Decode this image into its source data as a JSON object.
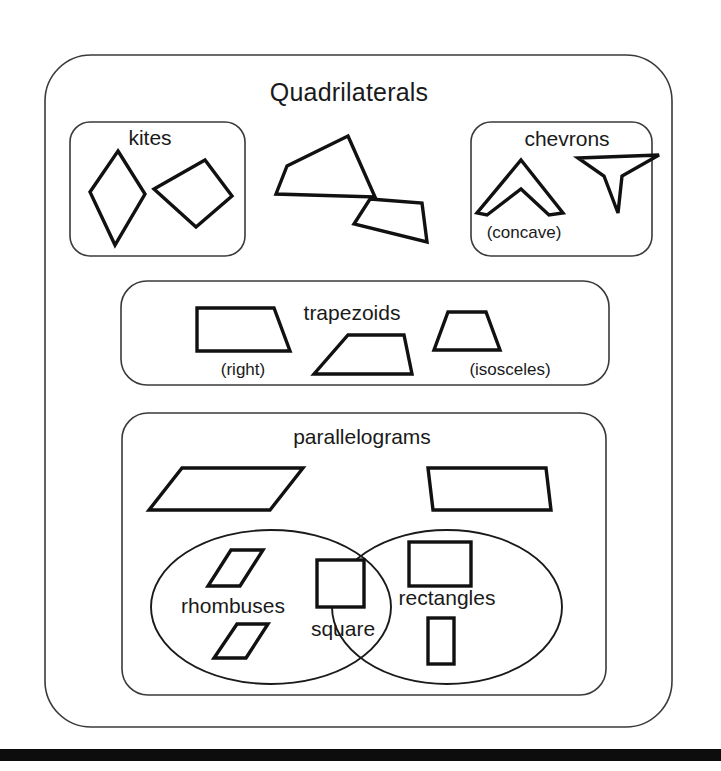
{
  "page": {
    "background": "#ffffff",
    "ink": "#111111",
    "frame_color": "#3a3a3a",
    "width": 721,
    "height": 771
  },
  "diagram": {
    "type": "euler-venn-classification",
    "title": "Quadrilaterals"
  },
  "outer": {
    "label": "Quadrilaterals",
    "box": {
      "x": 45,
      "y": 55,
      "w": 627,
      "h": 672,
      "r": 46
    },
    "title_pos": {
      "x": 349,
      "y": 101
    }
  },
  "kites": {
    "label": "kites",
    "box": {
      "x": 70,
      "y": 122,
      "w": 175,
      "h": 134,
      "r": 20
    },
    "label_pos": {
      "x": 150,
      "y": 145
    },
    "shapes": [
      {
        "name": "kite-tall-dart",
        "points": "118,151 145,194 115,245 90,192"
      },
      {
        "name": "kite-tilted",
        "points": "154,189 205,160 232,196 196,227"
      }
    ]
  },
  "chevrons": {
    "label": "chevrons",
    "sublabel": "(concave)",
    "box": {
      "x": 471,
      "y": 122,
      "w": 181,
      "h": 134,
      "r": 20
    },
    "label_pos": {
      "x": 567,
      "y": 146
    },
    "sublabel_pos": {
      "x": 524,
      "y": 238
    },
    "shapes": [
      {
        "name": "chevron-up-arrow",
        "points": "521,160 563,213 549,215 521,189 487,215 477,213"
      },
      {
        "name": "chevron-down-left-arrow",
        "points": "578,158 659,155 622,176 618,213 604,176"
      }
    ]
  },
  "loose_quadrilaterals": [
    {
      "name": "loose-quad-upper",
      "points": "348,136 375,197 276,194 287,166"
    },
    {
      "name": "loose-quad-lower",
      "points": "370,199 422,203 427,242 354,224"
    }
  ],
  "trapezoids": {
    "label": "trapezoids",
    "box": {
      "x": 121,
      "y": 281,
      "w": 488,
      "h": 104,
      "r": 26
    },
    "label_pos": {
      "x": 352,
      "y": 320
    },
    "items": [
      {
        "name": "right-trapezoid",
        "sublabel": "(right)",
        "sublabel_pos": {
          "x": 243,
          "y": 375
        },
        "points": "197,308 274,308 290,351 197,351"
      },
      {
        "name": "generic-trapezoid",
        "sublabel": "",
        "sublabel_pos": null,
        "points": "348,335 404,335 412,374 314,374"
      },
      {
        "name": "isosceles-trapezoid",
        "sublabel": "(isosceles)",
        "sublabel_pos": {
          "x": 510,
          "y": 375
        },
        "points": "448,312 486,312 500,350 434,350"
      }
    ]
  },
  "parallelograms": {
    "label": "parallelograms",
    "box": {
      "x": 122,
      "y": 413,
      "w": 484,
      "h": 282,
      "r": 26
    },
    "label_pos": {
      "x": 362,
      "y": 444
    },
    "shapes": [
      {
        "name": "parallelogram-wide-left",
        "points": "182,468 303,468 270,510 149,510"
      },
      {
        "name": "parallelogram-wide-right",
        "points": "428,468 546,468 551,510 433,510"
      }
    ],
    "venn": {
      "left": {
        "name": "rhombuses-set",
        "label": "rhombuses",
        "label_pos": {
          "x": 233,
          "y": 613
        },
        "cx": 271,
        "cy": 607,
        "rx": 120,
        "ry": 77,
        "shapes": [
          {
            "name": "rhombus-upper",
            "points": "231,550 263,550 240,586 208,586"
          },
          {
            "name": "rhombus-lower",
            "points": "237,624 268,624 246,658 214,658"
          }
        ]
      },
      "right": {
        "name": "rectangles-set",
        "label": "rectangles",
        "label_pos": {
          "x": 447,
          "y": 605
        },
        "cx": 447,
        "cy": 607,
        "rx": 115,
        "ry": 77,
        "shapes": [
          {
            "name": "rectangle-landscape",
            "x": 409,
            "y": 542,
            "w": 62,
            "h": 44
          },
          {
            "name": "rectangle-portrait",
            "x": 428,
            "y": 618,
            "w": 26,
            "h": 46
          }
        ]
      },
      "intersection": {
        "name": "square-set",
        "label": "square",
        "label_pos": {
          "x": 343,
          "y": 636
        },
        "shape": {
          "name": "square",
          "x": 317,
          "y": 560,
          "w": 47,
          "h": 47
        }
      }
    }
  },
  "bottom_bar": {
    "x": 0,
    "y": 749,
    "w": 721,
    "h": 12,
    "color": "#0d0d0d"
  }
}
